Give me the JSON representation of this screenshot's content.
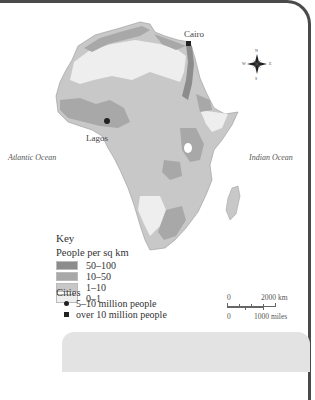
{
  "map": {
    "title": "Population density of Africa",
    "colors": {
      "density_50_100": "#8c8c8c",
      "density_10_50": "#a8a8a8",
      "density_1_10": "#c8c8c8",
      "density_0_1": "#eeeeee",
      "frame": "#4a4a4a",
      "panel": "#e3e3e3"
    },
    "cities": [
      {
        "name": "Cairo",
        "type": "over 10 million people"
      },
      {
        "name": "Lagos",
        "type": "over 10 million people"
      }
    ],
    "oceans": [
      {
        "name": "Atlantic Ocean"
      },
      {
        "name": "Indian Ocean"
      }
    ],
    "compass": {
      "n": "N",
      "s": "S",
      "e": "E",
      "w": "W"
    }
  },
  "key": {
    "title": "Key",
    "density_title": "People per sq km",
    "density_classes": [
      {
        "label": "50–100",
        "color": "#8c8c8c"
      },
      {
        "label": "10–50",
        "color": "#a8a8a8"
      },
      {
        "label": "1–10",
        "color": "#c8c8c8"
      },
      {
        "label": "0–1",
        "color": "#eeeeee"
      }
    ],
    "cities_title": "Cities",
    "city_classes": [
      {
        "label": "5–10 million people",
        "symbol": "circle"
      },
      {
        "label": "over 10 million people",
        "symbol": "square"
      }
    ]
  },
  "scale": {
    "top_start": "0",
    "top_end": "2000 km",
    "bottom_start": "0",
    "bottom_end": "1000 miles"
  }
}
